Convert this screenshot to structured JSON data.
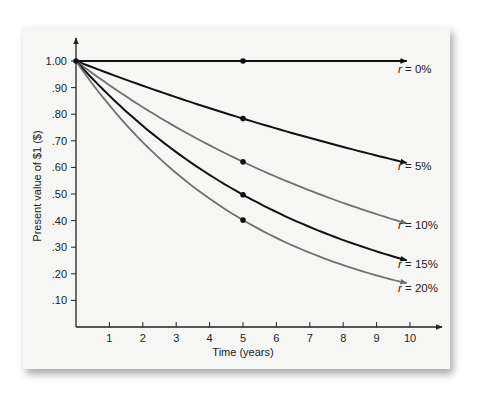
{
  "chart_data": {
    "type": "line",
    "title": "",
    "xlabel": "Time (years)",
    "ylabel": "Present value of $1 ($)",
    "xlim": [
      0,
      10
    ],
    "ylim": [
      0,
      1.0
    ],
    "grid": false,
    "legend_position": "inline-right",
    "x_ticks": [
      "1",
      "2",
      "3",
      "4",
      "5",
      "6",
      "7",
      "8",
      "9",
      "10"
    ],
    "y_ticks": [
      "1.00",
      ".90",
      ".80",
      ".70",
      ".60",
      ".50",
      ".40",
      ".30",
      ".20",
      ".10"
    ],
    "x": [
      0,
      1,
      2,
      3,
      4,
      5,
      6,
      7,
      8,
      9,
      10
    ],
    "series": [
      {
        "name": "r = 0%",
        "rate": 0.0,
        "color": "#111111",
        "values": [
          1.0,
          1.0,
          1.0,
          1.0,
          1.0,
          1.0,
          1.0,
          1.0,
          1.0,
          1.0,
          1.0
        ],
        "marker_at_5": 1.0
      },
      {
        "name": "r = 5%",
        "rate": 0.05,
        "color": "#111111",
        "values": [
          1.0,
          0.952,
          0.907,
          0.864,
          0.823,
          0.784,
          0.746,
          0.711,
          0.677,
          0.645,
          0.614
        ],
        "marker_at_5": 0.78
      },
      {
        "name": "r = 10%",
        "rate": 0.1,
        "color": "#707070",
        "values": [
          1.0,
          0.909,
          0.826,
          0.751,
          0.683,
          0.621,
          0.564,
          0.513,
          0.467,
          0.424,
          0.386
        ],
        "marker_at_5": 0.62
      },
      {
        "name": "r = 15%",
        "rate": 0.15,
        "color": "#111111",
        "values": [
          1.0,
          0.87,
          0.756,
          0.658,
          0.572,
          0.497,
          0.432,
          0.376,
          0.327,
          0.284,
          0.247
        ],
        "marker_at_5": 0.5
      },
      {
        "name": "r = 20%",
        "rate": 0.2,
        "color": "#707070",
        "values": [
          1.0,
          0.833,
          0.694,
          0.579,
          0.482,
          0.402,
          0.335,
          0.279,
          0.233,
          0.194,
          0.162
        ],
        "marker_at_5": 0.4
      }
    ]
  },
  "labels": {
    "r_prefix": "r",
    "series": [
      "= 0%",
      "= 5%",
      "= 10%",
      "= 15%",
      "= 20%"
    ]
  }
}
